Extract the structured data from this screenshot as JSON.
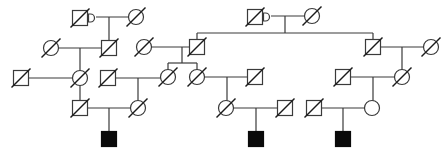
{
  "diagram": {
    "type": "pedigree",
    "title": "",
    "colors": {
      "line": "#3a3a3a",
      "affected_fill": "#0a0a0a",
      "unaffected_fill": "#ffffff"
    },
    "symbol_size": 15,
    "individuals": [
      {
        "id": "L-I-1",
        "sex": "male",
        "x": 80,
        "y": 18,
        "deceased": true,
        "affected": false,
        "marker": "proband-indicator-D"
      },
      {
        "id": "L-I-2",
        "sex": "female",
        "x": 136,
        "y": 17,
        "deceased": true,
        "affected": false
      },
      {
        "id": "L-II-1",
        "sex": "female",
        "x": 51,
        "y": 48,
        "deceased": true,
        "affected": false
      },
      {
        "id": "L-II-2",
        "sex": "male",
        "x": 109,
        "y": 48,
        "deceased": true,
        "affected": false
      },
      {
        "id": "L-III-1",
        "sex": "male",
        "x": 21,
        "y": 78,
        "deceased": true,
        "affected": false
      },
      {
        "id": "L-III-2",
        "sex": "female",
        "x": 80,
        "y": 78,
        "deceased": true,
        "affected": false
      },
      {
        "id": "L-IV-1",
        "sex": "male",
        "x": 80,
        "y": 108,
        "deceased": true,
        "affected": false
      },
      {
        "id": "L-IV-2",
        "sex": "female",
        "x": 138,
        "y": 108,
        "deceased": true,
        "affected": false
      },
      {
        "id": "L-V-1",
        "sex": "male",
        "x": 109,
        "y": 139,
        "deceased": false,
        "affected": true
      },
      {
        "id": "M-I-1",
        "sex": "male",
        "x": 255,
        "y": 17,
        "deceased": true,
        "affected": false,
        "marker": "proband-indicator-D"
      },
      {
        "id": "M-I-2",
        "sex": "female",
        "x": 312,
        "y": 16,
        "deceased": true,
        "affected": false
      },
      {
        "id": "M-II-1",
        "sex": "female",
        "x": 144,
        "y": 47,
        "deceased": true,
        "affected": false
      },
      {
        "id": "M-II-2",
        "sex": "male",
        "x": 197,
        "y": 47,
        "deceased": true,
        "affected": false
      },
      {
        "id": "M-III-0",
        "sex": "male",
        "x": 108,
        "y": 78,
        "deceased": true,
        "affected": false
      },
      {
        "id": "M-III-1",
        "sex": "female",
        "x": 168,
        "y": 77,
        "deceased": true,
        "affected": false
      },
      {
        "id": "M-III-2",
        "sex": "female",
        "x": 197,
        "y": 77,
        "deceased": true,
        "affected": false
      },
      {
        "id": "M-III-3",
        "sex": "male",
        "x": 255,
        "y": 77,
        "deceased": true,
        "affected": false
      },
      {
        "id": "M-IV-1",
        "sex": "female",
        "x": 226,
        "y": 108,
        "deceased": true,
        "affected": false
      },
      {
        "id": "M-IV-2",
        "sex": "male",
        "x": 285,
        "y": 108,
        "deceased": true,
        "affected": false
      },
      {
        "id": "M-V-1",
        "sex": "male",
        "x": 256,
        "y": 139,
        "deceased": false,
        "affected": true
      },
      {
        "id": "R-II-1",
        "sex": "male",
        "x": 373,
        "y": 47,
        "deceased": true,
        "affected": false
      },
      {
        "id": "R-II-2",
        "sex": "female",
        "x": 431,
        "y": 47,
        "deceased": true,
        "affected": false
      },
      {
        "id": "R-III-1",
        "sex": "male",
        "x": 343,
        "y": 77,
        "deceased": true,
        "affected": false
      },
      {
        "id": "R-III-2",
        "sex": "female",
        "x": 402,
        "y": 77,
        "deceased": true,
        "affected": false
      },
      {
        "id": "R-IV-1",
        "sex": "male",
        "x": 314,
        "y": 108,
        "deceased": true,
        "affected": false
      },
      {
        "id": "R-IV-2",
        "sex": "female",
        "x": 372,
        "y": 108,
        "deceased": false,
        "affected": false
      },
      {
        "id": "R-V-1",
        "sex": "male",
        "x": 343,
        "y": 139,
        "deceased": false,
        "affected": true
      }
    ],
    "lines": [
      {
        "kind": "mating",
        "x1": 96,
        "y1": 17,
        "x2": 129,
        "y2": 17
      },
      {
        "kind": "descent",
        "x1": 109,
        "y1": 17,
        "x2": 109,
        "y2": 41
      },
      {
        "kind": "mating",
        "x1": 58,
        "y1": 48,
        "x2": 102,
        "y2": 48
      },
      {
        "kind": "descent",
        "x1": 80,
        "y1": 48,
        "x2": 80,
        "y2": 71
      },
      {
        "kind": "mating",
        "x1": 28,
        "y1": 78,
        "x2": 73,
        "y2": 78
      },
      {
        "kind": "descent",
        "x1": 80,
        "y1": 85,
        "x2": 80,
        "y2": 101
      },
      {
        "kind": "mating",
        "x1": 87,
        "y1": 108,
        "x2": 131,
        "y2": 108
      },
      {
        "kind": "descent",
        "x1": 109,
        "y1": 108,
        "x2": 109,
        "y2": 132
      },
      {
        "kind": "mating",
        "x1": 271,
        "y1": 16,
        "x2": 305,
        "y2": 16
      },
      {
        "kind": "descent",
        "x1": 285,
        "y1": 16,
        "x2": 285,
        "y2": 33
      },
      {
        "kind": "sibship",
        "x1": 197,
        "y1": 33,
        "x2": 373,
        "y2": 33
      },
      {
        "kind": "descent",
        "x1": 197,
        "y1": 33,
        "x2": 197,
        "y2": 40
      },
      {
        "kind": "descent",
        "x1": 373,
        "y1": 33,
        "x2": 373,
        "y2": 40
      },
      {
        "kind": "mating",
        "x1": 151,
        "y1": 47,
        "x2": 190,
        "y2": 47
      },
      {
        "kind": "descent",
        "x1": 182,
        "y1": 47,
        "x2": 182,
        "y2": 63
      },
      {
        "kind": "sibship",
        "x1": 168,
        "y1": 63,
        "x2": 197,
        "y2": 63
      },
      {
        "kind": "descent",
        "x1": 168,
        "y1": 63,
        "x2": 168,
        "y2": 70
      },
      {
        "kind": "descent",
        "x1": 197,
        "y1": 63,
        "x2": 197,
        "y2": 70
      },
      {
        "kind": "mating",
        "x1": 115,
        "y1": 78,
        "x2": 161,
        "y2": 78
      },
      {
        "kind": "descent",
        "x1": 138,
        "y1": 78,
        "x2": 138,
        "y2": 101
      },
      {
        "kind": "mating",
        "x1": 204,
        "y1": 77,
        "x2": 248,
        "y2": 77
      },
      {
        "kind": "descent",
        "x1": 227,
        "y1": 77,
        "x2": 227,
        "y2": 101
      },
      {
        "kind": "mating",
        "x1": 233,
        "y1": 108,
        "x2": 278,
        "y2": 108
      },
      {
        "kind": "descent",
        "x1": 256,
        "y1": 108,
        "x2": 256,
        "y2": 132
      },
      {
        "kind": "mating",
        "x1": 380,
        "y1": 47,
        "x2": 424,
        "y2": 47
      },
      {
        "kind": "descent",
        "x1": 402,
        "y1": 47,
        "x2": 402,
        "y2": 70
      },
      {
        "kind": "mating",
        "x1": 350,
        "y1": 77,
        "x2": 395,
        "y2": 77
      },
      {
        "kind": "descent",
        "x1": 373,
        "y1": 77,
        "x2": 373,
        "y2": 101
      },
      {
        "kind": "mating",
        "x1": 321,
        "y1": 108,
        "x2": 365,
        "y2": 108
      },
      {
        "kind": "descent",
        "x1": 343,
        "y1": 108,
        "x2": 343,
        "y2": 132
      }
    ]
  }
}
